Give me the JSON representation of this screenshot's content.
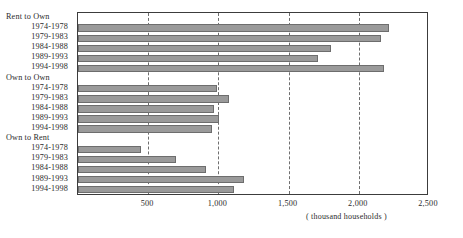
{
  "chart_data": {
    "type": "bar",
    "orientation": "horizontal",
    "title": "",
    "xlabel": "( thousand households )",
    "ylabel": "",
    "xlim": [
      0,
      2500
    ],
    "xticks": [
      0,
      500,
      1000,
      1500,
      2000,
      2500
    ],
    "xticklabels": [
      "",
      "500",
      "1,000",
      "1,500",
      "2,000",
      "2,500"
    ],
    "grid": true,
    "legend": "none",
    "groups": [
      {
        "name": "Rent to Own",
        "categories": [
          "1974-1978",
          "1979-1983",
          "1984-1988",
          "1989-1993",
          "1994-1998"
        ],
        "values": [
          2215,
          2155,
          1800,
          1710,
          2180
        ]
      },
      {
        "name": "Own to Own",
        "categories": [
          "1974-1978",
          "1979-1983",
          "1984-1988",
          "1989-1993",
          "1994-1998"
        ],
        "values": [
          990,
          1075,
          970,
          1005,
          955
        ]
      },
      {
        "name": "Own to Rent",
        "categories": [
          "1974-1978",
          "1979-1983",
          "1984-1988",
          "1989-1993",
          "1994-1998"
        ],
        "values": [
          450,
          700,
          910,
          1180,
          1110
        ]
      }
    ],
    "bar_color": "#9a9a9a",
    "bar_edge_color": "#6d6d6d",
    "frame_color": "#3c3c3c",
    "gridline_color": "#6e6e6e"
  },
  "axis": {
    "unit_label": "( thousand households )"
  }
}
